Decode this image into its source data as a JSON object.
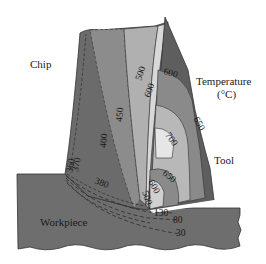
{
  "labels": {
    "chip": "Chip",
    "temperature": "Temperature",
    "temperature_unit": "(°C)",
    "tool": "Tool",
    "workpiece": "Workpiece"
  },
  "isotherms": {
    "chip": [
      "360",
      "370",
      "380",
      "400",
      "450",
      "500",
      "600"
    ],
    "tool": [
      "600",
      "650",
      "700",
      "650",
      "600",
      "500"
    ],
    "workpiece": [
      "130",
      "80",
      "30"
    ]
  },
  "iso_labels": {
    "c360": "360",
    "c370": "370",
    "c380": "380",
    "c400": "400",
    "c450": "450",
    "c500": "500",
    "c600": "600",
    "t600_top": "600",
    "t650_outer": "650",
    "t700": "700",
    "t650_inner": "650",
    "t600_inner": "600",
    "t500": "500",
    "w130": "130",
    "w80": "80",
    "w30": "30"
  },
  "colors": {
    "workpiece": "#6e6e6e",
    "chip_dark": "#6b6b6b",
    "chip_mid": "#8c8c8c",
    "chip_light": "#b0b0b0",
    "chip_lightest": "#cfcfcf",
    "tool_dark": "#5e5e5e",
    "tool_mid": "#8a8a8a",
    "tool_light": "#b8b8b8",
    "tool_hot": "#e6e6e6"
  }
}
